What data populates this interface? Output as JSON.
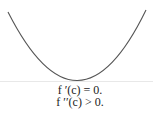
{
  "diagram": {
    "curve": {
      "shape": "parabola-concave-up",
      "color": "#555555",
      "left_end": [
        8,
        12
      ],
      "vertex": [
        78,
        81
      ],
      "right_end": [
        146,
        10
      ]
    },
    "baseline": {
      "color": "#e6e6e6",
      "y": 81
    },
    "labels": {
      "first_derivative": "f ′(c) = 0.",
      "second_derivative": "f ′′(c) > 0."
    }
  }
}
